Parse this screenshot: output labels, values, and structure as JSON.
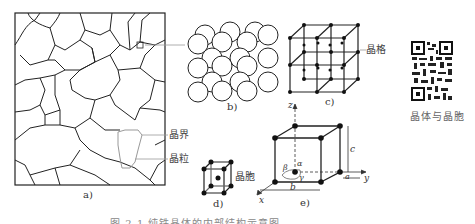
{
  "figure": {
    "caption": "图 2-1  纯铁晶体的内部结构示意图",
    "panels": [
      {
        "id": "a",
        "label": "a)",
        "description": "grain structure micrograph sketch"
      },
      {
        "id": "b",
        "label": "b)",
        "description": "atomic sphere packing model"
      },
      {
        "id": "c",
        "label": "c)",
        "description": "crystal lattice"
      },
      {
        "id": "d",
        "label": "d)",
        "description": "unit cell"
      },
      {
        "id": "e",
        "label": "e)",
        "description": "unit cell with lattice parameters"
      }
    ],
    "annotations": {
      "grain_boundary": "晶界",
      "grain": "晶粒",
      "lattice": "晶格",
      "unit_cell": "晶胞"
    },
    "axes": {
      "x": "x",
      "y": "y",
      "z": "z"
    },
    "parameters": {
      "a": "a",
      "b": "b",
      "c": "c",
      "alpha": "α",
      "beta": "β",
      "gamma": "γ"
    },
    "qr": {
      "label": "晶体与晶胞"
    }
  }
}
